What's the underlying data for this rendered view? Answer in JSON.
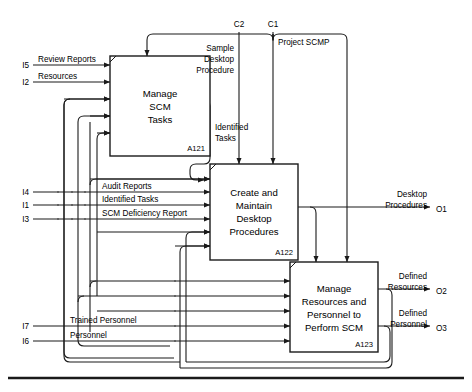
{
  "diagram": {
    "type": "idef0",
    "colors": {
      "line": "#1a1a1a",
      "fill": "#ffffff",
      "text": "#000000"
    },
    "boxes": [
      {
        "id": "A121",
        "title_lines": [
          "Manage",
          "SCM",
          "Tasks"
        ],
        "node_label": "A121",
        "x": 110,
        "y": 56,
        "w": 100,
        "h": 100
      },
      {
        "id": "A122",
        "title_lines": [
          "Create and",
          "Maintain",
          "Desktop",
          "Procedures"
        ],
        "node_label": "A122",
        "x": 210,
        "y": 164,
        "w": 88,
        "h": 96
      },
      {
        "id": "A123",
        "title_lines": [
          "Manage",
          "Resources and",
          "Personnel to",
          "Perform SCM"
        ],
        "node_label": "A123",
        "x": 290,
        "y": 262,
        "w": 88,
        "h": 90
      }
    ],
    "controls": [
      {
        "id": "C2",
        "label": "C2",
        "x": 239,
        "y": 24
      },
      {
        "id": "C1",
        "label": "C1",
        "x": 273,
        "y": 24
      }
    ],
    "control_flows": [
      {
        "id": "sample-desktop-procedure",
        "label_lines": [
          "Sample",
          "Desktop",
          "Procedure"
        ],
        "x": 218,
        "y": 48
      },
      {
        "id": "project-scmp",
        "label_lines": [
          "Project SCMP"
        ],
        "x": 265,
        "y": 45
      }
    ],
    "inputs": [
      {
        "id": "I5",
        "port": "I5",
        "label": "Review Reports",
        "y": 65
      },
      {
        "id": "I2",
        "port": "I2",
        "label": "Resources",
        "y": 82
      },
      {
        "id": "I4",
        "port": "I4",
        "label": "Audit Reports",
        "y": 192
      },
      {
        "id": "I1",
        "port": "I1",
        "label": "Identified Tasks",
        "y": 205
      },
      {
        "id": "I3",
        "port": "I3",
        "label": "SCM Deficiency Report",
        "y": 219
      },
      {
        "id": "I7",
        "port": "I7",
        "label": "Trained Personnel",
        "y": 326
      },
      {
        "id": "I6",
        "port": "I6",
        "label": "Personnel",
        "y": 341
      }
    ],
    "internal_flows": [
      {
        "id": "identified-tasks-internal",
        "label_lines": [
          "Identified",
          "Tasks"
        ],
        "x": 214,
        "y": 131
      }
    ],
    "outputs": [
      {
        "id": "O1",
        "port": "O1",
        "label_lines": [
          "Desktop",
          "Procedures"
        ],
        "y": 207
      },
      {
        "id": "O2",
        "port": "O2",
        "label_lines": [
          "Defined",
          "Resources"
        ],
        "y": 289
      },
      {
        "id": "O3",
        "port": "O3",
        "label_lines": [
          "Defined",
          "Personnel"
        ],
        "y": 326
      }
    ]
  }
}
